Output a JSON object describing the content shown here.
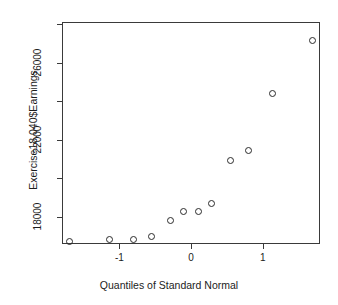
{
  "chart_data": {
    "type": "scatter",
    "title": "",
    "xlabel": "Quantiles of Standard Normal",
    "ylabel": "Exercise18.040$Earnings",
    "xlim": [
      -1.8,
      1.8
    ],
    "ylim": [
      16600,
      28100
    ],
    "xticks": [
      -1,
      0,
      1
    ],
    "xticklabels": [
      "-1",
      "0",
      "1"
    ],
    "yticks": [
      18000,
      22000,
      26000
    ],
    "yticklabels": [
      "18000",
      "22000",
      "26000"
    ],
    "grid": false,
    "legend": null,
    "marker": "open-circle",
    "series": [
      {
        "name": "Earnings quantiles",
        "points": [
          {
            "x": -1.7,
            "y": 16710
          },
          {
            "x": -1.14,
            "y": 16840
          },
          {
            "x": -0.8,
            "y": 16840
          },
          {
            "x": -0.55,
            "y": 16970
          },
          {
            "x": -0.29,
            "y": 17810
          },
          {
            "x": -0.1,
            "y": 18260
          },
          {
            "x": 0.1,
            "y": 18260
          },
          {
            "x": 0.29,
            "y": 18710
          },
          {
            "x": 0.55,
            "y": 20900
          },
          {
            "x": 0.8,
            "y": 21450
          },
          {
            "x": 1.14,
            "y": 24420
          },
          {
            "x": 1.7,
            "y": 27130
          }
        ]
      }
    ]
  },
  "axis": {
    "x_tick_labels": [
      "-1",
      "0",
      "1"
    ],
    "y_tick_labels": [
      "18000",
      "22000",
      "26000"
    ],
    "x_title": "Quantiles of Standard Normal",
    "y_title": "Exercise18.040$Earnings"
  },
  "style": {
    "frame_color": "#3a3a3a",
    "point_color": "#2b2b2b",
    "background": "#ffffff",
    "text_color": "#1c1c1c"
  }
}
